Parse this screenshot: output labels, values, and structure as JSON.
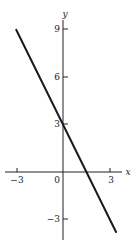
{
  "chart_data": {
    "type": "line",
    "title": "",
    "xlabel": "x",
    "ylabel": "y",
    "xlim": [
      -3.7,
      3.8
    ],
    "ylim": [
      -4.3,
      9.6
    ],
    "grid": false,
    "legend": null,
    "x_ticks": [
      -3,
      0,
      3
    ],
    "x_tick_labels": [
      "−3",
      "0",
      "3"
    ],
    "y_ticks": [
      -3,
      3,
      6,
      9
    ],
    "y_tick_labels": [
      "−3",
      "3",
      "6",
      "9"
    ],
    "series": [
      {
        "name": "y = 3 - 2x",
        "x": [
          -3,
          3.4
        ],
        "y": [
          9,
          -3.8
        ],
        "color": "#1a1a1a"
      }
    ],
    "annotations": []
  },
  "labels": {
    "x_axis": "x",
    "y_axis": "y",
    "origin": "0",
    "x_neg3": "−3",
    "x_pos3": "3",
    "y_9": "9",
    "y_6": "6",
    "y_3": "3",
    "y_neg3": "−3"
  }
}
